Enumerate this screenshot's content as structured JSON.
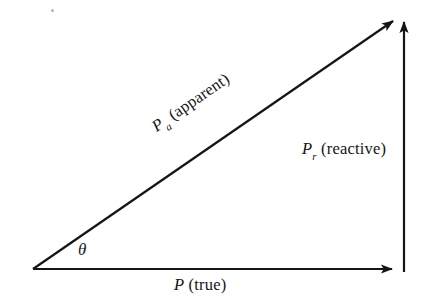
{
  "figure": {
    "background_color": "#ffffff",
    "stroke_color": "#151515",
    "stroke_width": 2,
    "labels": {
      "apparent": {
        "symbol": "P",
        "subscript": "a",
        "qualifier": "(apparent)",
        "full_text": "P_a (apparent)",
        "rotation_deg": -34.5
      },
      "reactive": {
        "symbol": "P",
        "subscript": "r",
        "qualifier": "(reactive)",
        "full_text": "P_r (reactive)",
        "rotation_deg": 0
      },
      "true_power": {
        "symbol": "P",
        "subscript": "",
        "qualifier": "(true)",
        "full_text": "P (true)",
        "rotation_deg": 0
      },
      "angle": {
        "symbol": "θ",
        "full_text": "θ"
      }
    },
    "geometry": {
      "origin_vertex": [
        33,
        269
      ],
      "right_vertex": [
        398,
        269
      ],
      "apex_vertex": [
        397,
        18
      ],
      "vertical_top": [
        404,
        14
      ],
      "vertical_bottom": [
        404,
        272
      ],
      "angle_theta_deg": 34.5
    }
  }
}
